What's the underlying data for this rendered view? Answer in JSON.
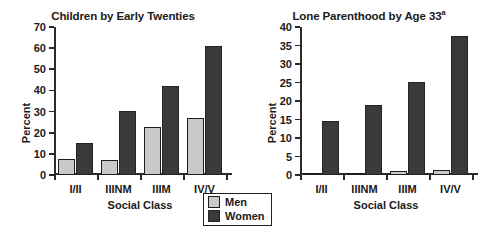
{
  "legend": {
    "entries": [
      {
        "label": "Men",
        "color": "#c9c9c9"
      },
      {
        "label": "Women",
        "color": "#3a3a3a"
      }
    ]
  },
  "chart_data": [
    {
      "type": "bar",
      "title": "Children by Early Twenties",
      "title_superscript": "",
      "xlabel": "Social Class",
      "ylabel": "Percent",
      "categories": [
        "I/II",
        "IIINM",
        "IIIM",
        "IV/V"
      ],
      "series": [
        {
          "name": "Men",
          "color": "#c9c9c9",
          "values": [
            7.5,
            7.0,
            22.5,
            27.0
          ]
        },
        {
          "name": "Women",
          "color": "#3a3a3a",
          "values": [
            15.0,
            30.5,
            42.0,
            61.0
          ]
        }
      ],
      "ylim": [
        0,
        70
      ],
      "yticks": [
        0,
        10,
        20,
        30,
        40,
        50,
        60,
        70
      ],
      "grid": false,
      "legend_position": "bottom-center"
    },
    {
      "type": "bar",
      "title": "Lone Parenthood by Age 33",
      "title_superscript": "a",
      "xlabel": "Social Class",
      "ylabel": "Percent",
      "categories": [
        "I/II",
        "IIINM",
        "IIIM",
        "IV/V"
      ],
      "series": [
        {
          "name": "Men",
          "color": "#c9c9c9",
          "values": [
            0.5,
            0.5,
            1.2,
            1.3
          ]
        },
        {
          "name": "Women",
          "color": "#3a3a3a",
          "values": [
            14.5,
            19.0,
            25.2,
            37.6
          ]
        }
      ],
      "ylim": [
        0,
        40
      ],
      "yticks": [
        0,
        5,
        10,
        15,
        20,
        25,
        30,
        35,
        40
      ],
      "grid": false,
      "legend_position": "bottom-center"
    }
  ]
}
